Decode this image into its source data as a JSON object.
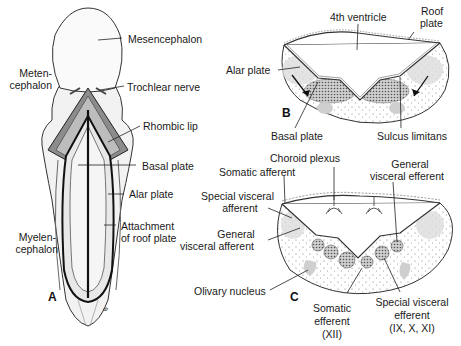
{
  "figure": {
    "panel_a": {
      "letter": "A",
      "labels": {
        "mesencephalon": "Mesencephalon",
        "metencephalon_1": "Meten-",
        "metencephalon_2": "cephalon",
        "trochlear_nerve": "Trochlear nerve",
        "rhombic_lip": "Rhombic lip",
        "basal_plate": "Basal plate",
        "alar_plate": "Alar plate",
        "attachment_1": "Attachment",
        "attachment_2": "of roof plate",
        "myelencephalon_1": "Myelen-",
        "myelencephalon_2": "cephalon"
      },
      "signature": "dr"
    },
    "panel_b": {
      "letter": "B",
      "labels": {
        "fourth_ventricle": "4th ventricle",
        "roof_plate_1": "Roof",
        "roof_plate_2": "plate",
        "alar_plate": "Alar plate",
        "basal_plate": "Basal plate",
        "sulcus_limitans": "Sulcus limitans"
      }
    },
    "panel_c": {
      "letter": "C",
      "labels": {
        "choroid_plexus": "Choroid plexus",
        "somatic_afferent": "Somatic afferent",
        "special_visceral_afferent_1": "Special visceral",
        "special_visceral_afferent_2": "afferent",
        "general_visceral_afferent_1": "General",
        "general_visceral_afferent_2": "visceral afferent",
        "olivary_nucleus": "Olivary nucleus",
        "general_visceral_efferent_1": "General",
        "general_visceral_efferent_2": "visceral efferent",
        "somatic_efferent_1": "Somatic",
        "somatic_efferent_2": "efferent",
        "somatic_efferent_3": "(XII)",
        "special_visceral_efferent_1": "Special visceral",
        "special_visceral_efferent_2": "efferent",
        "special_visceral_efferent_3": "(IX, X, XI)"
      }
    }
  }
}
